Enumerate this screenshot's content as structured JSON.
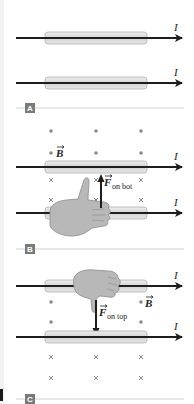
{
  "figure": {
    "panels": [
      {
        "label": "A",
        "wires": [
          {
            "current_label": "I",
            "direction": "right"
          },
          {
            "current_label": "I",
            "direction": "right"
          }
        ],
        "field_markers": []
      },
      {
        "label": "B",
        "wires": [
          {
            "current_label": "I",
            "direction": "right"
          },
          {
            "current_label": "I",
            "direction": "right"
          }
        ],
        "field_label": "B",
        "field_above_top_wire": "out-of-page (dots)",
        "field_below_top_wire": "into-page (crosses)",
        "force_label": "F",
        "force_subscript": "on bot",
        "force_direction": "up",
        "hand": "right-hand thumb up"
      },
      {
        "label": "C",
        "wires": [
          {
            "current_label": "I",
            "direction": "right"
          },
          {
            "current_label": "I",
            "direction": "right"
          }
        ],
        "field_label": "B",
        "field_above_bottom_wire": "out-of-page (dots)",
        "field_below_bottom_wire": "into-page (crosses)",
        "force_label": "F",
        "force_subscript": "on top",
        "force_direction": "down",
        "hand": "right-hand thumb down"
      }
    ],
    "colors": {
      "wire": "#1e1e1e",
      "tube_fill": "#d9d9d9",
      "tube_stroke": "#b0b0b0",
      "marker": "#8a8a8a",
      "hand_fill": "#b8b8b8",
      "hand_stroke": "#8c8c8c",
      "tag_bg": "#7a7a7a",
      "divider": "#d0d0d0"
    }
  }
}
